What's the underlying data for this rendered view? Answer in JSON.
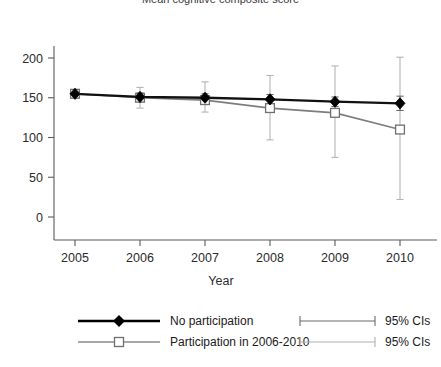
{
  "title": "Mean cognitive composite score",
  "axes": {
    "xlabel": "Year",
    "ylabel": "",
    "yticks": [
      "0",
      "50",
      "100",
      "150",
      "200"
    ],
    "xticks": [
      "2005",
      "2006",
      "2007",
      "2008",
      "2009",
      "2010"
    ]
  },
  "legend": {
    "entries": [
      {
        "label": "No participation",
        "marker": "filled-diamond",
        "color": "#000000"
      },
      {
        "label": "Participation in 2006-2010",
        "marker": "open-square",
        "color": "#808080"
      }
    ],
    "ci_entries": [
      {
        "label": "95% CIs",
        "color": "#3a3a3a"
      },
      {
        "label": "95% CIs",
        "color": "#9a9a9a"
      }
    ]
  },
  "chart_data": {
    "type": "line",
    "title": "Mean cognitive composite score",
    "xlabel": "Year",
    "ylabel": "",
    "x": [
      2005,
      2006,
      2007,
      2008,
      2009,
      2010
    ],
    "categories": [
      "2005",
      "2006",
      "2007",
      "2008",
      "2009",
      "2010"
    ],
    "xlim": [
      2004.6,
      2010.6
    ],
    "ylim": [
      -30,
      230
    ],
    "yticks": [
      0,
      50,
      100,
      150,
      200
    ],
    "grid": false,
    "legend_position": "bottom",
    "series": [
      {
        "name": "No participation",
        "marker": "filled-diamond",
        "color": "#000000",
        "values": [
          155,
          151,
          150,
          148,
          145,
          143
        ],
        "ci_lower": [
          153,
          146,
          145,
          142,
          139,
          134
        ],
        "ci_upper": [
          157,
          156,
          155,
          154,
          151,
          152
        ],
        "ci_label": "95% CIs"
      },
      {
        "name": "Participation in 2006-2010",
        "marker": "open-square",
        "color": "#808080",
        "values": [
          155,
          150,
          147,
          137,
          131,
          110
        ],
        "ci_lower": [
          152,
          137,
          132,
          97,
          75,
          22
        ],
        "ci_upper": [
          158,
          163,
          170,
          178,
          190,
          201
        ],
        "ci_label": "95% CIs"
      }
    ]
  }
}
